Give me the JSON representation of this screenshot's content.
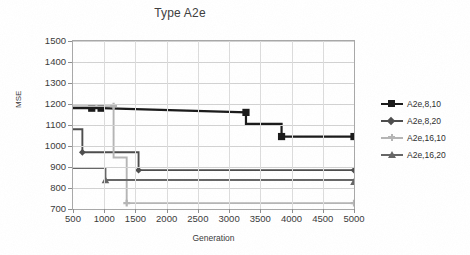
{
  "chart_data": {
    "type": "line",
    "title": "Type A2e",
    "xlabel": "Generation",
    "ylabel": "MSE",
    "xlim": [
      500,
      5000
    ],
    "ylim": [
      700,
      1500
    ],
    "xticks": [
      500,
      1000,
      1500,
      2000,
      2500,
      3000,
      3500,
      4000,
      4500,
      5000
    ],
    "yticks": [
      700,
      800,
      900,
      1000,
      1100,
      1200,
      1300,
      1400,
      1500
    ],
    "grid": "horizontal",
    "legend_position": "right",
    "step_style": "post",
    "series": [
      {
        "name": "A2e,8,10",
        "color": "#1a1a1a",
        "marker": "square",
        "x": [
          500,
          800,
          950,
          3270,
          3270,
          3840,
          3840,
          5000
        ],
        "y": [
          1180,
          1180,
          1180,
          1160,
          1105,
          1105,
          1045,
          1045
        ],
        "marker_points": [
          {
            "x": 800,
            "y": 1180
          },
          {
            "x": 950,
            "y": 1180
          },
          {
            "x": 3270,
            "y": 1160
          },
          {
            "x": 3840,
            "y": 1045
          },
          {
            "x": 5000,
            "y": 1045
          }
        ]
      },
      {
        "name": "A2e,8,20",
        "color": "#4d4d4d",
        "marker": "diamond",
        "x": [
          500,
          650,
          650,
          1550,
          1550,
          5000
        ],
        "y": [
          1080,
          1080,
          970,
          970,
          885,
          885
        ],
        "marker_points": [
          {
            "x": 650,
            "y": 970
          },
          {
            "x": 1550,
            "y": 885
          },
          {
            "x": 5000,
            "y": 885
          }
        ]
      },
      {
        "name": "A2e,16,10",
        "color": "#b5b5b5",
        "marker": "plus",
        "x": [
          500,
          1150,
          1150,
          1360,
          1360,
          5000
        ],
        "y": [
          1190,
          1190,
          945,
          945,
          728,
          728
        ],
        "marker_points": [
          {
            "x": 1150,
            "y": 1190
          },
          {
            "x": 1360,
            "y": 728
          },
          {
            "x": 5000,
            "y": 728
          }
        ]
      },
      {
        "name": "A2e,16,20",
        "color": "#666666",
        "marker": "triangle",
        "x": [
          500,
          1020,
          1020,
          5000
        ],
        "y": [
          895,
          895,
          838,
          838
        ],
        "marker_points": [
          {
            "x": 1020,
            "y": 838
          },
          {
            "x": 5000,
            "y": 830
          }
        ]
      }
    ]
  },
  "legend": {
    "items": [
      {
        "label": "A2e,8,10",
        "color": "#1a1a1a",
        "marker": "square"
      },
      {
        "label": "A2e,8,20",
        "color": "#4d4d4d",
        "marker": "diamond"
      },
      {
        "label": "A2e,16,10",
        "color": "#b5b5b5",
        "marker": "plus"
      },
      {
        "label": "A2e,16,20",
        "color": "#666666",
        "marker": "triangle"
      }
    ]
  }
}
